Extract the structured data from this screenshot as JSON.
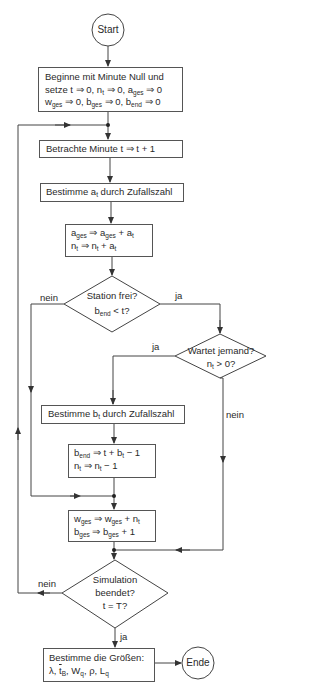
{
  "diagram": {
    "type": "flowchart",
    "language": "de",
    "start": {
      "label": "Start"
    },
    "end": {
      "label": "Ende"
    },
    "steps": [
      {
        "id": "init",
        "type": "process",
        "lines": [
          "Beginne mit Minute Null und",
          "setze t ⇒ 0, n_t ⇒ 0, a_ges ⇒ 0",
          "w_ges ⇒ 0, b_ges ⇒ 0, b_end ⇒ 0"
        ],
        "line1": "Beginne mit Minute Null und",
        "line2_a": "setze t ⇒ 0, n",
        "line2_sub1": "t",
        "line2_b": " ⇒ 0, a",
        "line2_sub2": "ges",
        "line2_c": " ⇒ 0",
        "line3_a": "w",
        "line3_sub1": "ges",
        "line3_b": " ⇒ 0, b",
        "line3_sub2": "ges",
        "line3_c": " ⇒ 0, b",
        "line3_sub3": "end",
        "line3_d": " ⇒ 0"
      },
      {
        "id": "next-minute",
        "type": "process",
        "text": "Betrachte Minute t ⇒ t + 1"
      },
      {
        "id": "arrivals",
        "type": "process",
        "text_a": "Bestimme a",
        "text_sub": "t",
        "text_b": " durch Zufallszahl",
        "text": "Bestimme a_t durch Zufallszahl"
      },
      {
        "id": "update-arrivals",
        "type": "process",
        "lines": [
          "a_ges ⇒ a_ges + a_t",
          "n_t ⇒ n_t + a_t"
        ],
        "l1_a": "a",
        "l1_s1": "ges",
        "l1_b": " ⇒ a",
        "l1_s2": "ges",
        "l1_c": " + a",
        "l1_s3": "t",
        "l2_a": "n",
        "l2_s1": "t",
        "l2_b": " ⇒ n",
        "l2_s2": "t",
        "l2_c": " + a",
        "l2_s3": "t"
      },
      {
        "id": "station-free",
        "type": "decision",
        "line1": "Station frei?",
        "line2_a": "b",
        "line2_sub": "end",
        "line2_b": " < t?",
        "yes": "ja",
        "no": "nein"
      },
      {
        "id": "someone-waiting",
        "type": "decision",
        "line1": "Wartet jemand?",
        "line2_a": "n",
        "line2_sub": "t",
        "line2_b": " > 0?",
        "yes": "ja",
        "no": "nein"
      },
      {
        "id": "service-time",
        "type": "process",
        "text_a": "Bestimme b",
        "text_sub": "t",
        "text_b": " durch Zufallszahl",
        "text": "Bestimme b_t durch Zufallszahl"
      },
      {
        "id": "start-service",
        "type": "process",
        "lines": [
          "b_end ⇒ t + b_t − 1",
          "n_t ⇒ n_t − 1"
        ],
        "l1_a": "b",
        "l1_s1": "end",
        "l1_b": " ⇒ t + b",
        "l1_s2": "t",
        "l1_c": " − 1",
        "l2_a": "n",
        "l2_s1": "t",
        "l2_b": " ⇒ n",
        "l2_s2": "t",
        "l2_c": " − 1"
      },
      {
        "id": "accumulate",
        "type": "process",
        "lines": [
          "w_ges ⇒ w_ges + n_t",
          "b_ges ⇒ b_ges + 1"
        ],
        "l1_a": "w",
        "l1_s1": "ges",
        "l1_b": " ⇒ w",
        "l1_s2": "ges",
        "l1_c": " + n",
        "l1_s3": "t",
        "l2_a": "b",
        "l2_s1": "ges",
        "l2_b": " ⇒ b",
        "l2_s2": "ges",
        "l2_c": " + 1"
      },
      {
        "id": "simulation-done",
        "type": "decision",
        "line1": "Simulation",
        "line2": "beendet?",
        "line3": "t = T?",
        "yes": "ja",
        "no": "nein"
      },
      {
        "id": "compute-results",
        "type": "process",
        "line1": "Bestimme die Größen:",
        "l2_a": "λ, ",
        "l2_tb": "t",
        "l2_tb_sub": "B",
        "l2_b": ", W",
        "l2_s1": "q",
        "l2_c": ", ρ, L",
        "l2_s2": "q",
        "lines": [
          "Bestimme die Größen:",
          "λ, t̄_B, W_q, ρ, L_q"
        ]
      }
    ],
    "colors": {
      "line": "#444444",
      "text": "#2a2a2a",
      "background": "#ffffff"
    }
  }
}
